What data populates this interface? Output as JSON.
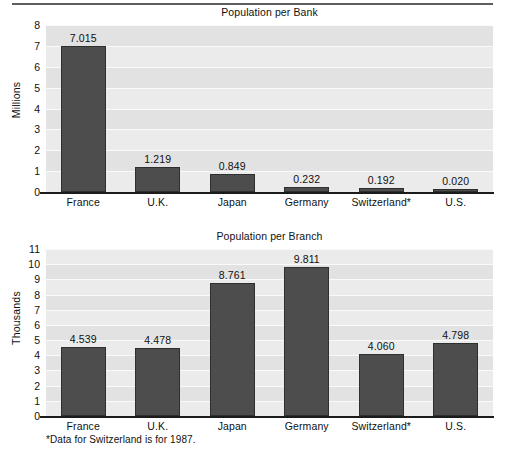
{
  "figure": {
    "footnote": "*Data for Switzerland is for 1987.",
    "bar_color": "#4d4d4d",
    "bar_border_color": "#2f2f2f",
    "plot_background": "#ebebeb",
    "band_color": "#e2e2e2",
    "axis_color": "#1b1b1b"
  },
  "chart_data": [
    {
      "type": "bar",
      "title": "Population per Bank",
      "xlabel": "",
      "ylabel": "Millions",
      "ylim": [
        0,
        8
      ],
      "yticks": [
        0,
        1,
        2,
        3,
        4,
        5,
        6,
        7,
        8
      ],
      "ytick_labels": [
        "0",
        "1",
        "2",
        "3",
        "4",
        "5",
        "6",
        "7",
        "8"
      ],
      "grid": true,
      "legend": "none",
      "categories": [
        "France",
        "U.K.",
        "Japan",
        "Germany",
        "Switzerland*",
        "U.S."
      ],
      "values": [
        7.015,
        1.219,
        0.849,
        0.232,
        0.192,
        0.02
      ],
      "value_labels": [
        "7.015",
        "1.219",
        "0.849",
        "0.232",
        "0.192",
        "0.020"
      ]
    },
    {
      "type": "bar",
      "title": "Population per Branch",
      "xlabel": "",
      "ylabel": "Thousands",
      "ylim": [
        0,
        11
      ],
      "yticks": [
        0,
        1,
        2,
        3,
        4,
        5,
        6,
        7,
        8,
        9,
        10,
        11
      ],
      "ytick_labels": [
        "0",
        "1",
        "2",
        "3",
        "4",
        "5",
        "6",
        "7",
        "8",
        "9",
        "10",
        "11"
      ],
      "grid": true,
      "legend": "none",
      "categories": [
        "France",
        "U.K.",
        "Japan",
        "Germany",
        "Switzerland*",
        "U.S."
      ],
      "values": [
        4.539,
        4.478,
        8.761,
        9.811,
        4.06,
        4.798
      ],
      "value_labels": [
        "4.539",
        "4.478",
        "8.761",
        "9.811",
        "4.060",
        "4.798"
      ]
    }
  ]
}
